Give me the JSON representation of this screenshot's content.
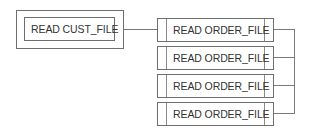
{
  "diagram": {
    "root": {
      "label": "READ CUST_FILE"
    },
    "children": [
      {
        "label": "READ ORDER_FILE"
      },
      {
        "label": "READ ORDER_FILE"
      },
      {
        "label": "READ ORDER_FILE"
      },
      {
        "label": "READ ORDER_FILE"
      }
    ],
    "colors": {
      "line": "#7a7a7a",
      "border": "#6e6e6e",
      "text": "#333333"
    }
  }
}
